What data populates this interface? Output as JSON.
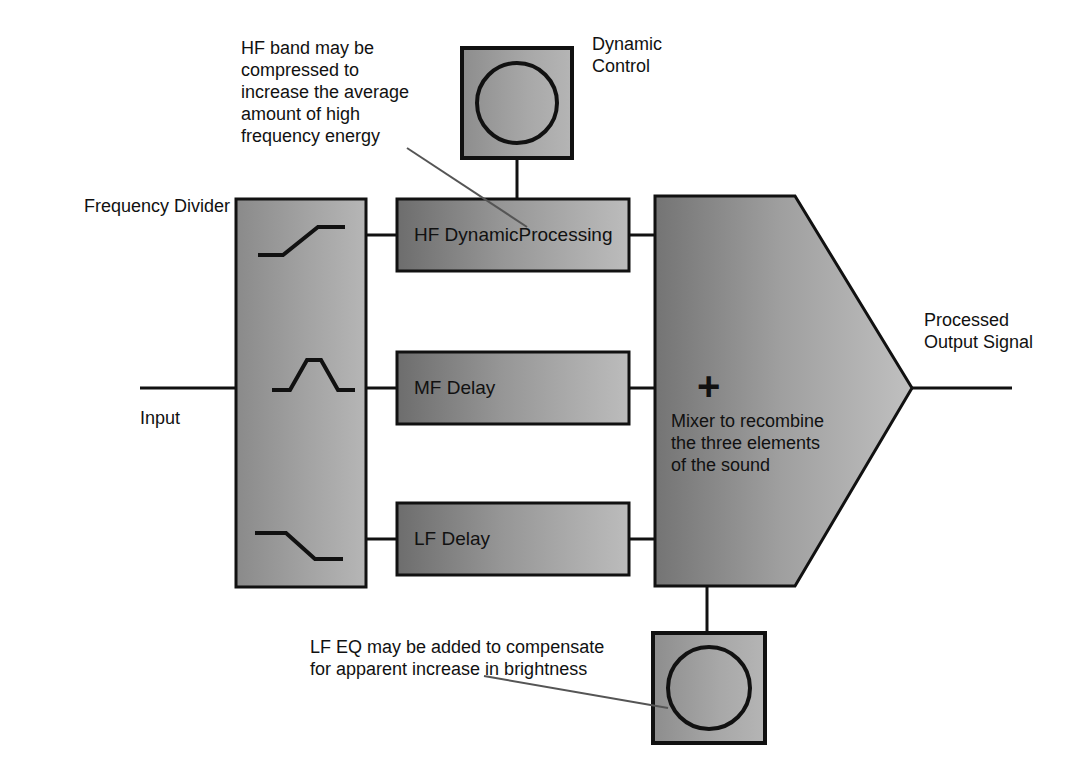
{
  "diagram": {
    "title_visible": false,
    "background_color": "#ffffff",
    "ink_color": "#111111",
    "blocks": [
      {
        "id": "frequency-divider",
        "label": "Frequency Divider",
        "label_position": "left-outside",
        "fill_from": "#8c8c8c",
        "fill_to": "#b4b4b4",
        "curves": [
          "highpass",
          "bandpass",
          "lowpass"
        ]
      },
      {
        "id": "hf-dynamic-processing",
        "label": "HF DynamicProcessing",
        "fill_from": "#6e6e6e",
        "fill_to": "#b9b9b9"
      },
      {
        "id": "mf-delay",
        "label": "MF Delay",
        "fill_from": "#6e6e6e",
        "fill_to": "#b9b9b9"
      },
      {
        "id": "lf-delay",
        "label": "LF Delay",
        "fill_from": "#6e6e6e",
        "fill_to": "#b9b9b9"
      },
      {
        "id": "mixer",
        "shape": "pentagon-arrow",
        "symbol": "+",
        "label": "Mixer to recombine\nthe three elements\nof the sound",
        "fill_from": "#767676",
        "fill_to": "#bdbdbd"
      },
      {
        "id": "dynamic-control",
        "shape": "square-with-knob",
        "label": "Dynamic\nControl",
        "fill_from": "#8f8f8f",
        "fill_to": "#b3b3b3"
      },
      {
        "id": "lf-eq-control",
        "shape": "square-with-knob",
        "fill_from": "#8f8f8f",
        "fill_to": "#b3b3b3"
      }
    ],
    "labels": {
      "frequency_divider": "Frequency Divider",
      "input": "Input",
      "dynamic_control_line1": "Dynamic",
      "dynamic_control_line2": "Control",
      "processed_output_line1": "Processed",
      "processed_output_line2": "Output Signal",
      "hf_block": "HF DynamicProcessing",
      "mf_block": "MF Delay",
      "lf_block": "LF Delay",
      "mixer_plus": "+",
      "mixer_note_line1": "Mixer to recombine",
      "mixer_note_line2": "the three elements",
      "mixer_note_line3": "of the sound"
    },
    "annotations": [
      {
        "id": "hf-note",
        "lines": [
          "HF band may be",
          "compressed to",
          "increase the average",
          "amount of high",
          "frequency energy"
        ],
        "leader_line_to": "hf-dynamic-processing"
      },
      {
        "id": "lf-eq-note",
        "lines": [
          "LF EQ may be added to compensate",
          "for apparent increase in brightness"
        ],
        "leader_line_to": "lf-eq-control"
      }
    ],
    "signal_flow": {
      "input_label": "Input",
      "output_label": "Processed Output Signal",
      "bands": [
        "HF",
        "MF",
        "LF"
      ]
    }
  }
}
